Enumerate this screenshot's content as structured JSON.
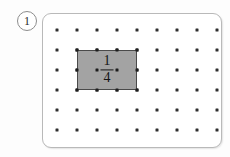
{
  "problem": {
    "number": "1"
  },
  "geoboard": {
    "grid": {
      "columns": 9,
      "rows": 7,
      "spacing_px": 20,
      "origin_x_px": 14,
      "origin_y_px": 16,
      "dot_color": "#2e2e2e"
    },
    "shaded_region": {
      "label_numerator": "1",
      "label_denominator": "4",
      "fill_color": "#a3a3a3",
      "border_color": "#4a4a4a",
      "start_column": 1,
      "start_row": 1,
      "width_cells": 3,
      "height_cells": 2
    },
    "card": {
      "border_color": "#b9b9b9",
      "background_color": "#ffffff"
    }
  }
}
